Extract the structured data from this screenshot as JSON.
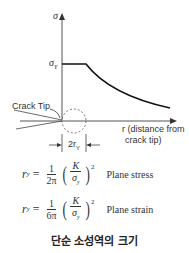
{
  "diagram": {
    "y_axis_label": "σ",
    "yield_label": "σ",
    "yield_sub": "Y",
    "x_axis_label_line1": "r (distance from",
    "x_axis_label_line2": "crack tip)",
    "crack_tip_label": "Crack Tip",
    "zone_label": "2r",
    "zone_sub": "Y"
  },
  "equations": [
    {
      "lhs": "r",
      "lhs_sub": "y",
      "num": "1",
      "den": "2π",
      "inner_num": "K",
      "inner_den": "σ",
      "inner_den_sub": "y",
      "power": "2",
      "label": "Plane stress"
    },
    {
      "lhs": "r",
      "lhs_sub": "y",
      "num": "1",
      "den": "6π",
      "inner_num": "K",
      "inner_den": "σ",
      "inner_den_sub": "y",
      "power": "2",
      "label": "Plane strain"
    }
  ],
  "caption": "단순 소성역의 크기"
}
